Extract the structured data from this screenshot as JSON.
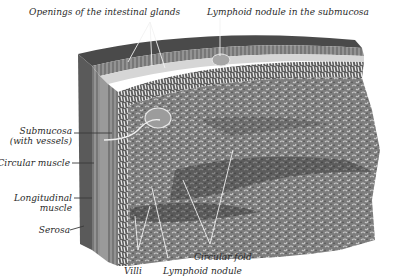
{
  "figure": {
    "colors": {
      "background": "#ffffff",
      "ink": "#2a2a2a",
      "tissue_dark": "#3e3e3e",
      "tissue_mid": "#7d7d7d",
      "tissue_light": "#b4b4b4",
      "leader_line": "#f2f2f2"
    }
  },
  "labels": {
    "top_left": "Openings of the intestinal glands",
    "top_right": "Lymphoid nodule in the submucosa",
    "submucosa_line1": "Submucosa",
    "submucosa_line2": "(with vessels)",
    "circular_muscle": "Circular muscle",
    "longitudinal_line1": "Longitudinal",
    "longitudinal_line2": "muscle",
    "serosa": "Serosa",
    "villi": "Villi",
    "lymphoid_nodule": "Lymphoid nodule",
    "circular_fold": "Circular fold"
  }
}
